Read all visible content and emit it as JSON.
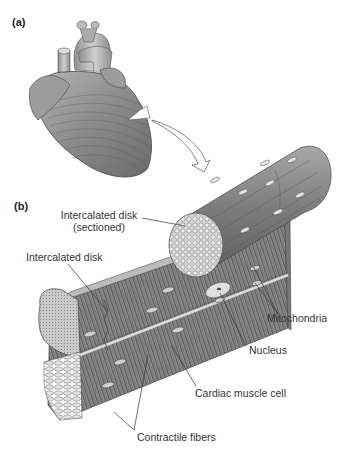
{
  "figure": {
    "panels": [
      {
        "id": "a",
        "label": "(a)",
        "subject": "heart"
      },
      {
        "id": "b",
        "label": "(b)",
        "subject": "cardiac muscle tissue"
      }
    ],
    "labels": {
      "intercalated_disk_sectioned_line1": "Intercalated disk",
      "intercalated_disk_sectioned_line2": "(sectioned)",
      "intercalated_disk": "Intercalated disk",
      "mitochondria": "Mitochondria",
      "nucleus": "Nucleus",
      "cardiac_muscle_cell": "Cardiac muscle cell",
      "contractile_fibers": "Contractile fibers"
    },
    "colors": {
      "tissue_dark": "#6e6e6e",
      "tissue_mid": "#9a9a9a",
      "tissue_light": "#c8c8c8",
      "leader_line": "#333333"
    }
  }
}
